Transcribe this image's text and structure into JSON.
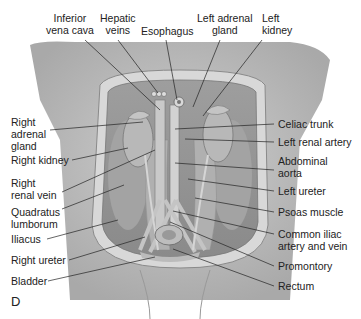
{
  "figure": {
    "panel_letter": "D",
    "labels": {
      "inferior_vena_cava": [
        "Inferior",
        "vena cava"
      ],
      "hepatic_veins": [
        "Hepatic",
        "veins"
      ],
      "esophagus": [
        "Esophagus"
      ],
      "left_adrenal_gland": [
        "Left adrenal",
        "gland"
      ],
      "left_kidney": [
        "Left",
        "kidney"
      ],
      "right_adrenal_gland": [
        "Right",
        "adrenal",
        "gland"
      ],
      "right_kidney": [
        "Right kidney"
      ],
      "right_renal_vein": [
        "Right",
        "renal vein"
      ],
      "quadratus_lumborum": [
        "Quadratus",
        "lumborum"
      ],
      "iliacus": [
        "Iliacus"
      ],
      "right_ureter": [
        "Right ureter"
      ],
      "bladder": [
        "Bladder"
      ],
      "celiac_trunk": [
        "Celiac trunk"
      ],
      "left_renal_artery": [
        "Left renal artery"
      ],
      "abdominal_aorta": [
        "Abdominal",
        "aorta"
      ],
      "left_ureter": [
        "Left ureter"
      ],
      "psoas_muscle": [
        "Psoas muscle"
      ],
      "common_iliac": [
        "Common iliac",
        "artery and vein"
      ],
      "promontory": [
        "Promontory"
      ],
      "rectum": [
        "Rectum"
      ]
    }
  }
}
